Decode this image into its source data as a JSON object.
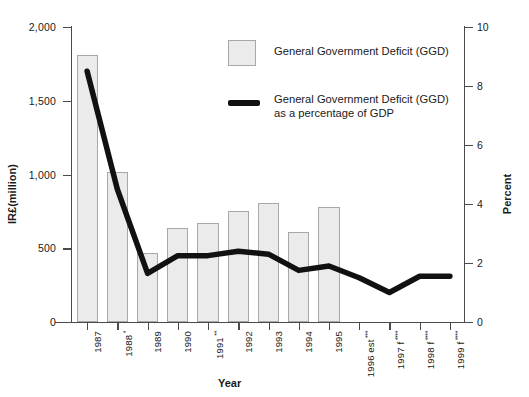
{
  "chart_data": {
    "type": "bar",
    "title": "",
    "xlabel": "Year",
    "ylabel": "IR£(million)",
    "y2label": "Percent",
    "ylim": [
      0,
      2000
    ],
    "y2lim": [
      0,
      10
    ],
    "grid": false,
    "legend_position": "top-center",
    "categories": [
      "1987",
      "1988 *",
      "1989",
      "1990",
      "1991 **",
      "1992",
      "1993",
      "1994",
      "1995",
      "1996 est ***",
      "1997 f ****",
      "1998 f ****",
      "1999 f ****"
    ],
    "category_base": [
      "1987",
      "1988",
      "1989",
      "1990",
      "1991",
      "1992",
      "1993",
      "1994",
      "1995",
      "1996 est",
      "1997 f",
      "1998 f",
      "1999 f"
    ],
    "category_marks": [
      "",
      "*",
      "",
      "",
      "**",
      "",
      "",
      "",
      "",
      "***",
      "****",
      "****",
      "****"
    ],
    "series": [
      {
        "name": "General Government Deficit (GGD)",
        "type": "bar",
        "axis": "left",
        "unit": "IR£ million",
        "values": [
          1810,
          1020,
          465,
          635,
          670,
          755,
          805,
          610,
          780,
          null,
          null,
          null,
          null
        ]
      },
      {
        "name": "General Government Deficit (GGD) as a percentage of GDP",
        "type": "line",
        "axis": "right",
        "unit": "percent",
        "values": [
          8.5,
          4.5,
          1.65,
          2.25,
          2.25,
          2.4,
          2.3,
          1.75,
          1.9,
          1.5,
          1.0,
          1.55,
          1.55
        ]
      }
    ],
    "yticks": [
      "0",
      "500",
      "1,000",
      "1,500",
      "2,000"
    ],
    "ytick_values": [
      0,
      500,
      1000,
      1500,
      2000
    ],
    "y2ticks": [
      "0",
      "2",
      "4",
      "6",
      "8",
      "10"
    ],
    "y2tick_values": [
      0,
      2,
      4,
      6,
      8,
      10
    ]
  },
  "legend": {
    "bar_label": "General Government Deficit (GGD)",
    "line_label_line1": "General Government Deficit (GGD)",
    "line_label_line2": "as a percentage of GDP"
  },
  "colors": {
    "bar_fill": "#ebebeb",
    "bar_stroke": "#a8a8a8",
    "line": "#111111",
    "axis": "#4a4a4a",
    "text": "#1a1a1a"
  }
}
